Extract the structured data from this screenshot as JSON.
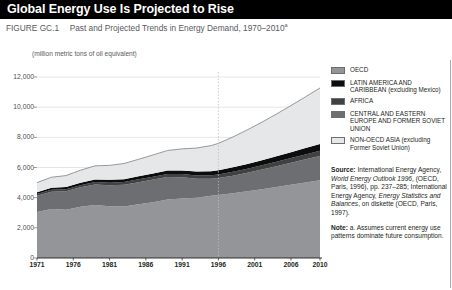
{
  "header": {
    "title": "Global Energy Use Is Projected to Rise",
    "figure_number": "FIGURE GC.1",
    "figure_caption": "Past and Projected Trends in Energy Demand, 1970–2010",
    "figure_footnote_marker": "a",
    "unit_label": "(million metric tons of oil equivalent)"
  },
  "legend": {
    "items": [
      {
        "label": "OECD",
        "color": "#939598"
      },
      {
        "label": "LATIN AMERICA AND CARIBBEAN (excluding Mexico)",
        "color": "#0d0d0d"
      },
      {
        "label": "AFRICA",
        "color": "#414042"
      },
      {
        "label": "CENTRAL AND EASTERN EUROPE AND FORMER SOVIET UNION",
        "color": "#6d6e71"
      },
      {
        "label": "NON-OECD ASIA (excluding Former Soviet Union)",
        "color": "#e6e7e8"
      }
    ]
  },
  "source": {
    "source_heading": "Source:",
    "source_text": " International Energy Agency, ",
    "source_italic1": "World Energy Outlook 1996",
    "source_text2": ", (OECD, Paris, 1996), pp. 237–285; International Energy Agency, ",
    "source_italic2": "Energy Statistics and Balances",
    "source_text3": ", on diskette (OECD, Paris, 1997).",
    "note_heading": "Note:",
    "note_text": " a. Assumes current energy use patterns dominate future consumption."
  },
  "chart_data": {
    "type": "area",
    "title": "Past and Projected Trends in Energy Demand, 1970–2010",
    "xlabel": "",
    "ylabel": "(million metric tons of oil equivalent)",
    "ylim": [
      0,
      12000
    ],
    "yticks": [
      0,
      2000,
      4000,
      6000,
      8000,
      10000,
      12000
    ],
    "ytick_labels": [
      "0",
      "2,000",
      "4,000",
      "6,000",
      "8,000",
      "10,000",
      "12,000"
    ],
    "xlim": [
      1971,
      2010
    ],
    "xticks": [
      1971,
      1976,
      1981,
      1986,
      1991,
      1996,
      2001,
      2006,
      2010
    ],
    "xtick_labels": [
      "1971",
      "1976",
      "1981",
      "1986",
      "1991",
      "1996",
      "2001",
      "2006",
      "2010"
    ],
    "grid": "horizontal",
    "legend_position": "right",
    "projection_divider_year": 1996,
    "stacked": true,
    "x": [
      1971,
      1973,
      1975,
      1977,
      1979,
      1981,
      1983,
      1985,
      1987,
      1989,
      1991,
      1993,
      1995,
      1996,
      1998,
      2000,
      2002,
      2004,
      2006,
      2008,
      2010
    ],
    "series": [
      {
        "name": "OECD",
        "color": "#939598",
        "values": [
          3050,
          3250,
          3200,
          3400,
          3520,
          3430,
          3420,
          3560,
          3700,
          3880,
          3950,
          4000,
          4120,
          4180,
          4300,
          4430,
          4560,
          4700,
          4850,
          5000,
          5150
        ]
      },
      {
        "name": "CENTRAL AND EASTERN EUROPE AND FORMER SOVIET UNION",
        "color": "#6d6e71",
        "values": [
          1080,
          1150,
          1230,
          1290,
          1360,
          1400,
          1440,
          1470,
          1500,
          1490,
          1400,
          1250,
          1130,
          1120,
          1160,
          1220,
          1300,
          1380,
          1460,
          1540,
          1620
        ]
      },
      {
        "name": "AFRICA",
        "color": "#414042",
        "values": [
          110,
          120,
          130,
          140,
          155,
          165,
          175,
          185,
          195,
          205,
          215,
          225,
          235,
          240,
          255,
          270,
          285,
          300,
          315,
          330,
          345
        ]
      },
      {
        "name": "LATIN AMERICA AND CARIBBEAN (excluding Mexico)",
        "color": "#0d0d0d",
        "values": [
          120,
          135,
          145,
          160,
          175,
          185,
          190,
          200,
          210,
          225,
          240,
          255,
          270,
          280,
          300,
          320,
          340,
          365,
          390,
          415,
          440
        ]
      },
      {
        "name": "NON-OECD ASIA (excluding Former Soviet Union)",
        "color": "#e6e7e8",
        "values": [
          640,
          700,
          760,
          830,
          900,
          960,
          1040,
          1130,
          1230,
          1330,
          1430,
          1560,
          1700,
          1780,
          2010,
          2260,
          2520,
          2800,
          3090,
          3400,
          3720
        ]
      }
    ],
    "totals": [
      5000,
      5355,
      5465,
      5820,
      6110,
      6140,
      6265,
      6545,
      6835,
      7130,
      7235,
      7290,
      7455,
      7600,
      8025,
      8500,
      9005,
      9545,
      10105,
      10685,
      11275
    ]
  }
}
